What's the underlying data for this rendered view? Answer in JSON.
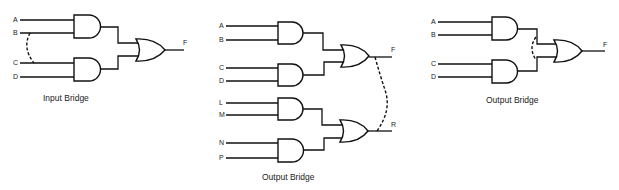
{
  "diagrams": [
    {
      "caption": "Input Bridge",
      "inputs": [
        "A",
        "B",
        "C",
        "D"
      ],
      "gates": [
        "AND",
        "AND",
        "OR"
      ],
      "output": "F",
      "bridge": "dashed bridge between inputs B and C"
    },
    {
      "caption": "Output Bridge",
      "inputs": [
        "A",
        "B",
        "C",
        "D",
        "L",
        "M",
        "N",
        "P"
      ],
      "gates": [
        "AND",
        "AND",
        "OR",
        "AND",
        "AND",
        "OR"
      ],
      "outputs": [
        "F",
        "R"
      ],
      "bridge": "dashed bridge between outputs F and R"
    },
    {
      "caption": "Output Bridge",
      "inputs": [
        "A",
        "B",
        "C",
        "D"
      ],
      "gates": [
        "AND",
        "AND",
        "OR"
      ],
      "output": "F",
      "bridge": "dashed bridge between AND gate outputs"
    }
  ],
  "labels": {
    "d1": {
      "A": "A",
      "B": "B",
      "C": "C",
      "D": "D",
      "F": "F",
      "caption": "Input Bridge"
    },
    "d2": {
      "A": "A",
      "B": "B",
      "C": "C",
      "D": "D",
      "L": "L",
      "M": "M",
      "N": "N",
      "P": "P",
      "F": "F",
      "R": "R",
      "caption": "Output Bridge"
    },
    "d3": {
      "A": "A",
      "B": "B",
      "C": "C",
      "D": "D",
      "F": "F",
      "caption": "Output Bridge"
    }
  }
}
